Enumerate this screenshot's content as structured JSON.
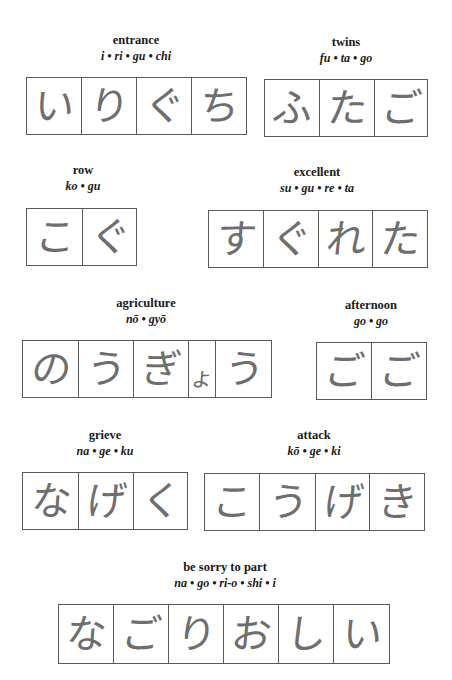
{
  "words": [
    {
      "meaning": "entrance",
      "romaji": "i • ri • gu • chi",
      "kana": [
        "い",
        "り",
        "ぐ",
        "ち"
      ]
    },
    {
      "meaning": "twins",
      "romaji": "fu • ta • go",
      "kana": [
        "ふ",
        "た",
        "ご"
      ]
    },
    {
      "meaning": "row",
      "romaji": "ko • gu",
      "kana": [
        "こ",
        "ぐ"
      ]
    },
    {
      "meaning": "excellent",
      "romaji": "su • gu • re • ta",
      "kana": [
        "す",
        "ぐ",
        "れ",
        "た"
      ]
    },
    {
      "meaning": "agriculture",
      "romaji": "nō • gyō",
      "kana": [
        "の",
        "う",
        "ぎ",
        "ょ",
        "う"
      ]
    },
    {
      "meaning": "afternoon",
      "romaji": "go • go",
      "kana": [
        "ご",
        "ご"
      ]
    },
    {
      "meaning": "grieve",
      "romaji": "na • ge • ku",
      "kana": [
        "な",
        "げ",
        "く"
      ]
    },
    {
      "meaning": "attack",
      "romaji": "kō • ge • ki",
      "kana": [
        "こ",
        "う",
        "げ",
        "き"
      ]
    },
    {
      "meaning": "be sorry to part",
      "romaji": "na • go • ri-o • shi • i",
      "kana": [
        "な",
        "ご",
        "り",
        "お",
        "し",
        "い"
      ]
    }
  ]
}
